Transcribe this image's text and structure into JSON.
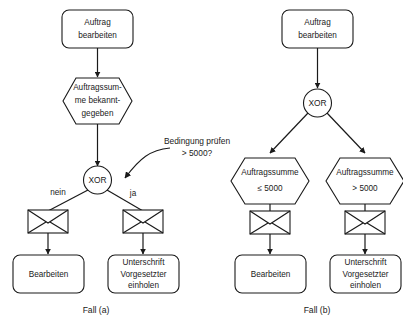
{
  "figure": {
    "type": "epc-process-diagram",
    "background_color": "#ffffff",
    "stroke_color": "#1a1a1a"
  },
  "case_a": {
    "caption": "Fall (a)",
    "function_top": {
      "line1": "Auftrag",
      "line2": "bearbeiten"
    },
    "event_top": {
      "line1": "Auftragssum-",
      "line2": "me bekannt-",
      "line3": "gegeben"
    },
    "connector": {
      "label": "XOR"
    },
    "branch_left_label": "nein",
    "branch_right_label": "ja",
    "annotation": {
      "line1": "Bedingung prüfen",
      "line2": "> 5000?"
    },
    "function_left": {
      "line1": "Bearbeiten"
    },
    "function_right": {
      "line1": "Unterschrift",
      "line2": "Vorgesetzter",
      "line3": "einholen"
    }
  },
  "case_b": {
    "caption": "Fall (b)",
    "function_top": {
      "line1": "Auftrag",
      "line2": "bearbeiten"
    },
    "connector": {
      "label": "XOR"
    },
    "event_left": {
      "line1": "Auftragssumme",
      "line2": "≤ 5000"
    },
    "event_right": {
      "line1": "Auftragssumme",
      "line2": "> 5000"
    },
    "function_left": {
      "line1": "Bearbeiten"
    },
    "function_right": {
      "line1": "Unterschrift",
      "line2": "Vorgesetzter",
      "line3": "einholen"
    }
  }
}
